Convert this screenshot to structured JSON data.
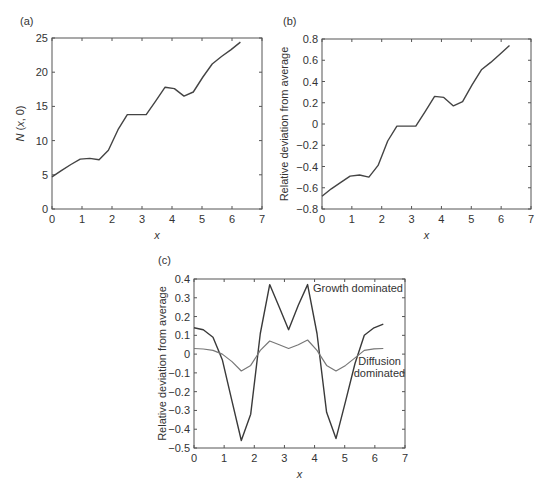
{
  "chart_data": [
    {
      "panel": "(a)",
      "type": "line",
      "title": "",
      "xlabel": "x",
      "ylabel": "N (x, 0)",
      "xlim": [
        0,
        7
      ],
      "ylim": [
        0,
        25
      ],
      "xticks": [
        0,
        1,
        2,
        3,
        4,
        5,
        6,
        7
      ],
      "yticks": [
        0,
        5,
        10,
        15,
        20,
        25
      ],
      "grid": false,
      "series": [
        {
          "name": "N(x,0)",
          "color": "#444444",
          "x": [
            0,
            0.31,
            0.63,
            0.94,
            1.26,
            1.57,
            1.88,
            2.2,
            2.51,
            2.83,
            3.14,
            3.46,
            3.77,
            4.08,
            4.4,
            4.71,
            5.03,
            5.34,
            5.65,
            5.97,
            6.28
          ],
          "y": [
            4.7,
            5.6,
            6.5,
            7.3,
            7.4,
            7.2,
            8.6,
            11.6,
            13.8,
            13.8,
            13.8,
            15.8,
            17.8,
            17.6,
            16.5,
            17.1,
            19.3,
            21.2,
            22.3,
            23.3,
            24.4
          ]
        }
      ]
    },
    {
      "panel": "(b)",
      "type": "line",
      "title": "",
      "xlabel": "x",
      "ylabel": "Relative deviation from average",
      "xlim": [
        0,
        7
      ],
      "ylim": [
        -0.8,
        0.8
      ],
      "xticks": [
        0,
        1,
        2,
        3,
        4,
        5,
        6,
        7
      ],
      "yticks": [
        -0.8,
        -0.6,
        -0.4,
        -0.2,
        0,
        0.2,
        0.4,
        0.6,
        0.8
      ],
      "ytick_labels": [
        "-0.8",
        "-0.6",
        "-0.4",
        "-0.2",
        "0",
        "0.2",
        "0.4",
        "0.6",
        "0.8"
      ],
      "grid": false,
      "series": [
        {
          "name": "relative deviation",
          "color": "#444444",
          "x": [
            0,
            0.31,
            0.63,
            0.94,
            1.26,
            1.57,
            1.88,
            2.2,
            2.51,
            2.83,
            3.14,
            3.46,
            3.77,
            4.08,
            4.4,
            4.71,
            5.03,
            5.34,
            5.65,
            5.97,
            6.28
          ],
          "y": [
            -0.68,
            -0.61,
            -0.55,
            -0.49,
            -0.48,
            -0.5,
            -0.39,
            -0.16,
            -0.02,
            -0.02,
            -0.02,
            0.12,
            0.26,
            0.25,
            0.17,
            0.21,
            0.37,
            0.51,
            0.58,
            0.66,
            0.74
          ]
        }
      ]
    },
    {
      "panel": "(c)",
      "type": "line",
      "title": "",
      "xlabel": "x",
      "ylabel": "Relative deviation from average",
      "xlim": [
        0,
        7
      ],
      "ylim": [
        -0.5,
        0.4
      ],
      "xticks": [
        0,
        1,
        2,
        3,
        4,
        5,
        6,
        7
      ],
      "yticks": [
        -0.5,
        -0.4,
        -0.3,
        -0.2,
        -0.1,
        0,
        0.1,
        0.2,
        0.3,
        0.4
      ],
      "ytick_labels": [
        "-0.5",
        "-0.4",
        "-0.3",
        "-0.2",
        "-0.1",
        "0",
        "0.1",
        "0.2",
        "0.3",
        "0.4"
      ],
      "grid": false,
      "annotations": [
        {
          "text": "Growth dominated",
          "x": 3.95,
          "y": 0.33
        },
        {
          "text": "Diffusion",
          "x": 5.45,
          "y": -0.06
        },
        {
          "text": "dominated",
          "x": 5.3,
          "y": -0.12
        }
      ],
      "series": [
        {
          "name": "Growth dominated",
          "color": "#3a3a3a",
          "x": [
            0,
            0.31,
            0.63,
            0.94,
            1.26,
            1.57,
            1.88,
            2.2,
            2.51,
            2.83,
            3.14,
            3.46,
            3.77,
            4.08,
            4.4,
            4.71,
            5.03,
            5.34,
            5.65,
            5.97,
            6.28
          ],
          "y": [
            0.14,
            0.13,
            0.09,
            -0.03,
            -0.25,
            -0.46,
            -0.32,
            0.11,
            0.37,
            0.25,
            0.13,
            0.26,
            0.37,
            0.11,
            -0.31,
            -0.45,
            -0.25,
            -0.05,
            0.1,
            0.14,
            0.16
          ]
        },
        {
          "name": "Diffusion dominated",
          "color": "#777777",
          "x": [
            0,
            0.31,
            0.63,
            0.94,
            1.26,
            1.57,
            1.88,
            2.2,
            2.51,
            2.83,
            3.14,
            3.46,
            3.77,
            4.08,
            4.4,
            4.71,
            5.03,
            5.34,
            5.65,
            5.97,
            6.28
          ],
          "y": [
            0.03,
            0.027,
            0.02,
            0.0,
            -0.04,
            -0.09,
            -0.06,
            0.02,
            0.07,
            0.05,
            0.03,
            0.05,
            0.075,
            0.02,
            -0.06,
            -0.09,
            -0.06,
            -0.02,
            0.02,
            0.028,
            0.03
          ]
        }
      ]
    }
  ],
  "layout": {
    "panels": [
      {
        "left": 52,
        "top": 38,
        "right": 262,
        "bottom": 209,
        "panel_label_x": 20,
        "panel_label_y": 25,
        "ylabel_x": 24
      },
      {
        "left": 322,
        "top": 39,
        "right": 531,
        "bottom": 209,
        "panel_label_x": 283,
        "panel_label_y": 25,
        "ylabel_x": 288
      },
      {
        "left": 194,
        "top": 279,
        "right": 405,
        "bottom": 448,
        "panel_label_x": 158,
        "panel_label_y": 264,
        "ylabel_x": 166
      }
    ]
  }
}
